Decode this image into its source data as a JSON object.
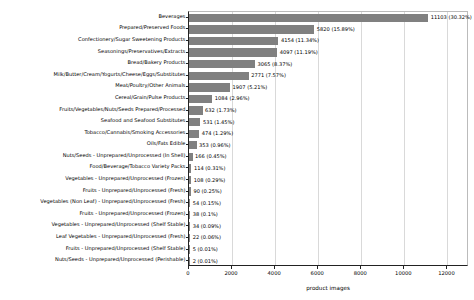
{
  "chart_data": {
    "type": "bar",
    "orientation": "horizontal",
    "title": "",
    "xlabel": "product images",
    "ylabel": "product families",
    "xlim": [
      0,
      13000
    ],
    "xticks": [
      0,
      2000,
      4000,
      6000,
      8000,
      10000,
      12000
    ],
    "grid": true,
    "bar_color": "#808080",
    "categories": [
      "Beverages",
      "Prepared/Preserved Foods",
      "Confectionery/Sugar Sweetening Products",
      "Seasonings/Preservatives/Extracts",
      "Bread/Bakery Products",
      "Milk/Butter/Cream/Yogurts/Cheese/Eggs/Substitutes",
      "Meat/Poultry/Other Animals",
      "Cereal/Grain/Pulse Products",
      "Fruits/Vegetables/Nuts/Seeds Prepared/Processed",
      "Seafood and Seafood Substitutes",
      "Tobacco/Cannabis/Smoking Accessories",
      "Oils/Fats Edible",
      "Nuts/Seeds - Unprepared/Unprocessed (In Shell)",
      "Food/Beverage/Tobacco Variety Packs",
      "Vegetables - Unprepared/Unprocessed (Frozen)",
      "Fruits - Unprepared/Unprocessed (Fresh)",
      "Vegetables (Non Leaf) - Unprepared/Unprocessed (Fresh)",
      "Fruits - Unprepared/Unprocessed (Frozen)",
      "Vegetables - Unprepared/Unprocessed (Shelf Stable)",
      "Leaf Vegetables - Unprepared/Unprocessed (Fresh)",
      "Fruits - Unprepared/Unprocessed (Shelf Stable)",
      "Nuts/Seeds - Unprepared/Unprocessed (Perishable)"
    ],
    "values": [
      11103,
      5820,
      4154,
      4097,
      3065,
      2771,
      1907,
      1084,
      632,
      531,
      474,
      353,
      166,
      114,
      108,
      90,
      54,
      38,
      34,
      22,
      5,
      2
    ],
    "percents": [
      "30.32%",
      "15.89%",
      "11.34%",
      "11.19%",
      "8.37%",
      "7.57%",
      "5.21%",
      "2.96%",
      "1.73%",
      "1.45%",
      "1.29%",
      "0.96%",
      "0.45%",
      "0.31%",
      "0.29%",
      "0.25%",
      "0.15%",
      "0.1%",
      "0.09%",
      "0.06%",
      "0.01%",
      "0.01%"
    ],
    "bar_labels": [
      "11103 (30.32%)",
      "5820 (15.89%)",
      "4154 (11.34%)",
      "4097 (11.19%)",
      "3065 (8.37%)",
      "2771 (7.57%)",
      "1907 (5.21%)",
      "1084 (2.96%)",
      "632 (1.73%)",
      "531 (1.45%)",
      "474 (1.29%)",
      "353 (0.96%)",
      "166 (0.45%)",
      "114 (0.31%)",
      "108 (0.29%)",
      "90 (0.25%)",
      "54 (0.15%)",
      "38 (0.1%)",
      "34 (0.09%)",
      "22 (0.06%)",
      "5 (0.01%)",
      "2 (0.01%)"
    ],
    "xtick_labels": [
      "0",
      "2000",
      "4000",
      "6000",
      "8000",
      "10000",
      "12000"
    ]
  }
}
